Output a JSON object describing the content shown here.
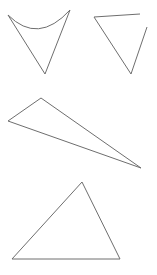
{
  "canvas": {
    "width": 157,
    "height": 275,
    "background": "#ffffff",
    "stroke_color": "#6e6e6e"
  },
  "shapes": [
    {
      "name": "curved-top-triangle",
      "type": "path",
      "d": "M8,15 Q38,45 70,10 L45,74 Z"
    },
    {
      "name": "open-triangle",
      "type": "polyline",
      "segments": [
        "M94,17 L140,14",
        "M94,17 L131,74 L147,27"
      ]
    },
    {
      "name": "thin-obtuse-triangle",
      "type": "polygon",
      "points": "8,121 41,98 141,168"
    },
    {
      "name": "acute-triangle",
      "type": "polygon",
      "points": "82,182 12,259 120,259"
    }
  ]
}
